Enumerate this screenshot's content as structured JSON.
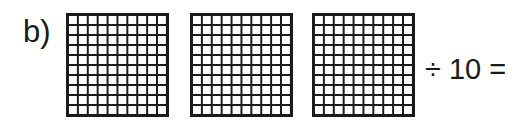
{
  "problem": {
    "label": "b)",
    "grids": [
      {
        "rows": 10,
        "cols": 10
      },
      {
        "rows": 10,
        "cols": 10
      },
      {
        "rows": 10,
        "cols": 10
      }
    ],
    "expression": "÷ 10 ="
  }
}
